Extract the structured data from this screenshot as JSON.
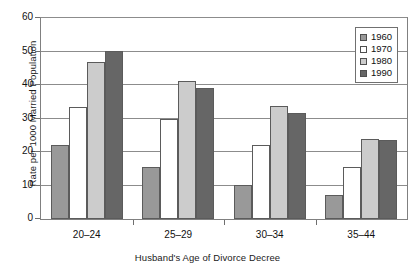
{
  "chart_data": {
    "type": "bar",
    "title": "",
    "xlabel": "Husband's Age of Divorce Decree",
    "ylabel": "Rate per 1000 Married Population",
    "categories": [
      "20–24",
      "25–29",
      "30–34",
      "35–44"
    ],
    "ylim": [
      0,
      60
    ],
    "yticks": [
      0,
      10,
      20,
      30,
      40,
      50,
      60
    ],
    "ytick_labels": [
      "0",
      "10",
      "20",
      "30",
      "40",
      "50",
      "60"
    ],
    "grid": true,
    "legend_position": "top-right",
    "series": [
      {
        "name": "1960",
        "color": "#999999",
        "values": [
          22.0,
          15.4,
          10.1,
          7.3
        ]
      },
      {
        "name": "1970",
        "color": "#ffffff",
        "values": [
          33.5,
          29.9,
          22.2,
          15.5
        ]
      },
      {
        "name": "1980",
        "color": "#cccccc",
        "values": [
          46.9,
          41.3,
          33.6,
          23.9
        ]
      },
      {
        "name": "1990",
        "color": "#666666",
        "values": [
          50.3,
          39.2,
          31.7,
          23.7
        ]
      }
    ]
  },
  "colors": {
    "axis": "#808080",
    "gridline": "#8c8c8c",
    "bar_outline": "#5b5b5b",
    "text": "#111111"
  }
}
